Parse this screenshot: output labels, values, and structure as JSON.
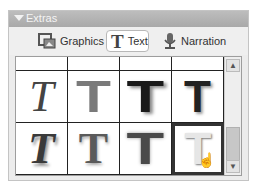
{
  "panel": {
    "title": "Extras",
    "collapse_icon": "triangle-down-icon"
  },
  "tabs": [
    {
      "label": "Graphics",
      "icon": "graphics-icon",
      "active": false
    },
    {
      "label": "Text",
      "icon": "text-T-icon",
      "active": true
    },
    {
      "label": "Narration",
      "icon": "microphone-icon",
      "active": false
    }
  ],
  "styles": {
    "glyph": "T",
    "rows": [
      [
        {
          "name": "text-style-line",
          "variant": "partial"
        },
        {
          "name": "text-style-partial-2",
          "variant": "partial"
        },
        {
          "name": "text-style-partial-3",
          "variant": "partial"
        },
        {
          "name": "text-style-partial-4",
          "variant": "partial"
        }
      ],
      [
        {
          "name": "text-style-italic-serif",
          "variant": "italic-serif",
          "color": "#444444"
        },
        {
          "name": "text-style-gray-block",
          "variant": "block",
          "color": "#7a7a7a"
        },
        {
          "name": "text-style-black-shadow",
          "variant": "block-shadow",
          "color": "#1a1a1a"
        },
        {
          "name": "text-style-black-narrow",
          "variant": "narrow-shadow",
          "color": "#222222"
        }
      ],
      [
        {
          "name": "text-style-bold-italic-shadow",
          "variant": "bold-italic",
          "color": "#3a3a3a"
        },
        {
          "name": "text-style-serif-shadow",
          "variant": "serif-shadow",
          "color": "#5a5a5a"
        },
        {
          "name": "text-style-dark-block",
          "variant": "block-soft",
          "color": "#4a4a4a"
        },
        {
          "name": "text-style-light-outline",
          "variant": "light",
          "color": "#e6e6e6",
          "selected": true
        }
      ]
    ]
  },
  "scrollbar": {
    "up_icon": "chevron-up-icon",
    "down_icon": "chevron-down-icon"
  },
  "cursor": "hand-pointer-icon"
}
